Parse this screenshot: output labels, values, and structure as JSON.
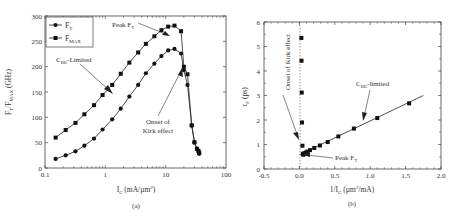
{
  "chart_data": [
    {
      "panel": "(a)",
      "type": "line",
      "xscale": "log",
      "xlabel": "I_C (mA/µm²)",
      "ylabel": "F_T/F_MAX (GHz)",
      "xlim": [
        0.1,
        100
      ],
      "ylim": [
        0,
        300
      ],
      "xticks": [
        "0.1",
        "1",
        "10",
        "100"
      ],
      "yticks": [
        "0",
        "50",
        "100",
        "150",
        "200",
        "250",
        "300"
      ],
      "legend": {
        "position": "upper left",
        "entries": [
          "F_T",
          "F_MAX"
        ]
      },
      "series": [
        {
          "name": "F_T",
          "marker": "circle",
          "x": [
            0.15,
            0.22,
            0.32,
            0.45,
            0.65,
            0.9,
            1.3,
            1.8,
            2.5,
            3.5,
            4.7,
            6.5,
            8.5,
            11,
            14,
            18,
            20,
            23,
            27,
            30,
            33,
            35,
            36
          ],
          "y": [
            18,
            25,
            33,
            44,
            58,
            76,
            96,
            117,
            141,
            164,
            187,
            206,
            221,
            232,
            235,
            226,
            193,
            164,
            84,
            50,
            38,
            32,
            28
          ]
        },
        {
          "name": "F_MAX",
          "marker": "square",
          "x": [
            0.15,
            0.22,
            0.32,
            0.45,
            0.65,
            0.9,
            1.3,
            1.8,
            2.5,
            3.5,
            4.7,
            6.5,
            8.5,
            11,
            14,
            18,
            20,
            23,
            27,
            30,
            33,
            35,
            36
          ],
          "y": [
            60,
            75,
            89,
            106,
            124,
            144,
            164,
            186,
            208,
            228,
            245,
            260,
            272,
            279,
            281,
            270,
            200,
            185,
            84,
            51,
            38,
            34,
            30
          ]
        }
      ],
      "annotations": [
        "Peak F_T",
        "C_BE-Limited",
        "Onset of Kirk effect"
      ]
    },
    {
      "panel": "(b)",
      "type": "scatter",
      "xlabel": "1/I_C (µm²/mA)",
      "ylabel": "τ_F (ps)",
      "xlim": [
        -0.5,
        2.0
      ],
      "ylim": [
        0,
        6
      ],
      "xticks": [
        "-0.5",
        "0.0",
        "0.5",
        "1.0",
        "1.5",
        "2.0"
      ],
      "yticks": [
        "0",
        "1",
        "2",
        "3",
        "4",
        "5",
        "6"
      ],
      "series": [
        {
          "name": "τ_F",
          "marker": "square",
          "x": [
            0.028,
            0.03,
            0.033,
            0.037,
            0.043,
            0.05,
            0.055,
            0.07,
            0.09,
            0.11,
            0.15,
            0.21,
            0.29,
            0.4,
            0.55,
            0.77,
            1.1,
            1.55
          ],
          "y": [
            5.35,
            4.42,
            3.12,
            1.9,
            0.95,
            0.62,
            0.58,
            0.64,
            0.67,
            0.71,
            0.77,
            0.86,
            0.96,
            1.1,
            1.33,
            1.65,
            2.08,
            2.68
          ]
        },
        {
          "name": "linear fit",
          "marker": "none",
          "x": [
            0.0,
            1.75
          ],
          "y": [
            0.58,
            3.0
          ]
        }
      ],
      "reference_line": {
        "x": 0.0,
        "style": "dashed"
      },
      "annotations": [
        "Onset of Kirk effect",
        "C_BE-limited",
        "Peak F_T"
      ]
    }
  ],
  "panel_a": {
    "caption": "(a)",
    "xlabel_main": "I",
    "xlabel_sub": "C",
    "xlabel_unit": " (mA/µm",
    "xlabel_sup": "2",
    "xlabel_end": ")",
    "ylabel": "F",
    "ylabel_sub1": "T",
    "ylabel_mid": "/F",
    "ylabel_sub2": "MAX",
    "ylabel_unit": " (GHz)",
    "legend_ft": "F",
    "legend_ft_sub": "T",
    "legend_fmax": "F",
    "legend_fmax_sub": "MAX",
    "ann_peak": "Peak F",
    "ann_peak_sub": "T",
    "ann_cbe": "C",
    "ann_cbe_sub": "BE",
    "ann_cbe_rest": "-Limited",
    "ann_kirk1": "Onset of",
    "ann_kirk2": "Kirk effect"
  },
  "panel_b": {
    "caption": "(b)",
    "xlabel_main": "1/I",
    "xlabel_sub": "C",
    "xlabel_unit": " (µm",
    "xlabel_sup": "2",
    "xlabel_end": "/mA)",
    "ylabel": "τ",
    "ylabel_sub": "F",
    "ylabel_unit": " (ps)",
    "ann_kirk": "Onset of Kirk effect",
    "ann_cbe": "C",
    "ann_cbe_sub": "BE",
    "ann_cbe_rest": "-limited",
    "ann_peak": "Peak F",
    "ann_peak_sub": "T"
  }
}
